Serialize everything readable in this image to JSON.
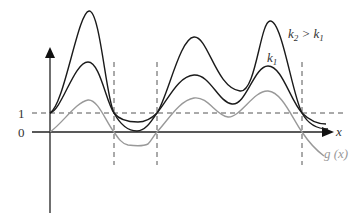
{
  "figure": {
    "width": 364,
    "height": 224,
    "colors": {
      "axis": "#111111",
      "dashed": "#555555",
      "curve_k2": "#1a1a1a",
      "curve_k1": "#1a1a1a",
      "curve_g": "#999999",
      "label": "#333333",
      "label_g": "#999999"
    },
    "axes": {
      "x_label": "x",
      "y_tick_1": "1",
      "y_tick_0": "0"
    },
    "curves": {
      "k2_label_main": "k",
      "k2_label_sub": "2",
      "k2_label_rel": " > k",
      "k2_label_rel_sub": "1",
      "k1_label_main": "k",
      "k1_label_sub": "1",
      "g_label": "g (x)"
    },
    "vertical_dashed_x": [
      114,
      157,
      302
    ],
    "intersection_points": [
      [
        50,
        113
      ],
      [
        114,
        113
      ],
      [
        157,
        113
      ],
      [
        302,
        113
      ]
    ],
    "zero_points_g": [
      [
        50,
        132
      ],
      [
        114,
        132
      ],
      [
        157,
        132
      ],
      [
        302,
        132
      ]
    ]
  }
}
